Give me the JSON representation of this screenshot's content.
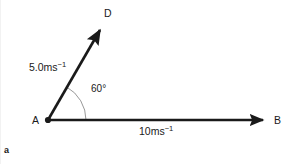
{
  "figure": {
    "caption": "a",
    "background_color": "#ffffff",
    "stroke_color": "#1a1a1a",
    "arc_color": "#8c8c8c"
  },
  "points": {
    "origin": {
      "name": "A",
      "label": "A",
      "x": 48,
      "y": 120
    },
    "tip_up": {
      "name": "D",
      "label": "D",
      "x": 103,
      "y": 25
    },
    "tip_right": {
      "name": "B",
      "label": "B",
      "x": 268,
      "y": 120
    }
  },
  "vectors": [
    {
      "name": "vector-AD",
      "from": "A",
      "to": "D",
      "magnitude_text": "5.0ms",
      "magnitude_exponent": "−1",
      "magnitude_full": "5.0ms⁻¹",
      "value": 5.0,
      "unit": "ms^-1",
      "direction_degrees": 60
    },
    {
      "name": "vector-AB",
      "from": "A",
      "to": "B",
      "magnitude_text": "10ms",
      "magnitude_exponent": "−1",
      "magnitude_full": "10ms⁻¹",
      "value": 10,
      "unit": "ms^-1",
      "direction_degrees": 0
    }
  ],
  "angle": {
    "name": "angle-DAB",
    "text": "60",
    "degree_symbol": "°",
    "full": "60°",
    "value": 60,
    "between": [
      "vector-AD",
      "vector-AB"
    ]
  }
}
